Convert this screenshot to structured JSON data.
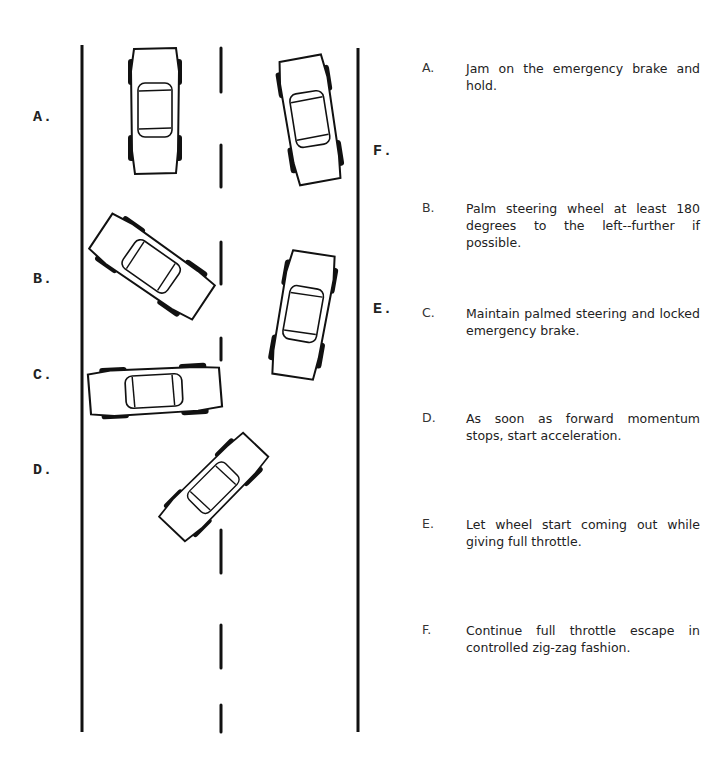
{
  "diagram": {
    "title_hidden": "Bootlegger's turn maneuver sequence",
    "labels": {
      "a": "A.",
      "b": "B.",
      "c": "C.",
      "d": "D.",
      "e": "E.",
      "f": "F."
    },
    "line_color": "#111111"
  },
  "steps": [
    {
      "letter": "A.",
      "text": "Jam on the emergency brake and hold."
    },
    {
      "letter": "B.",
      "text": "Palm steering wheel at least 180 degrees to the left--further if possible."
    },
    {
      "letter": "C.",
      "text": "Maintain palmed steering and locked emergency brake."
    },
    {
      "letter": "D.",
      "text": "As soon as forward momentum stops, start acceleration."
    },
    {
      "letter": "E.",
      "text": "Let wheel start coming out while giving full throttle."
    },
    {
      "letter": "F.",
      "text": "Continue full throttle escape in controlled zig-zag fashion."
    }
  ]
}
